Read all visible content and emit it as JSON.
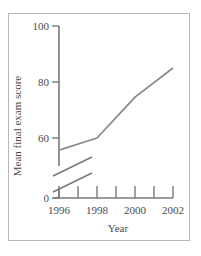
{
  "chart_data": {
    "type": "line",
    "title": "",
    "xlabel": "Year",
    "ylabel": "Mean final exam score",
    "x": [
      1996,
      1998,
      2000,
      2002
    ],
    "series": [
      {
        "name": "Mean final exam score",
        "values": [
          55.7,
          60,
          74.6,
          85
        ]
      }
    ],
    "x_tick_labels": [
      "1996",
      "1998",
      "2000",
      "2002"
    ],
    "x_minor_ticks": [
      1997,
      1999,
      2001
    ],
    "y_tick_labels": [
      "0",
      "60",
      "80",
      "100"
    ],
    "y_ticks": [
      0,
      60,
      80,
      100
    ],
    "xlim": [
      1996,
      2002
    ],
    "ylim": [
      0,
      100
    ],
    "y_axis_break": {
      "between": [
        0,
        60
      ]
    },
    "grid": false,
    "legend": "none",
    "colors": {
      "line": "#8a8a8a",
      "axis": "#7a7a7a",
      "text": "#4a4a4a",
      "frame": "#b8b8b8"
    }
  }
}
